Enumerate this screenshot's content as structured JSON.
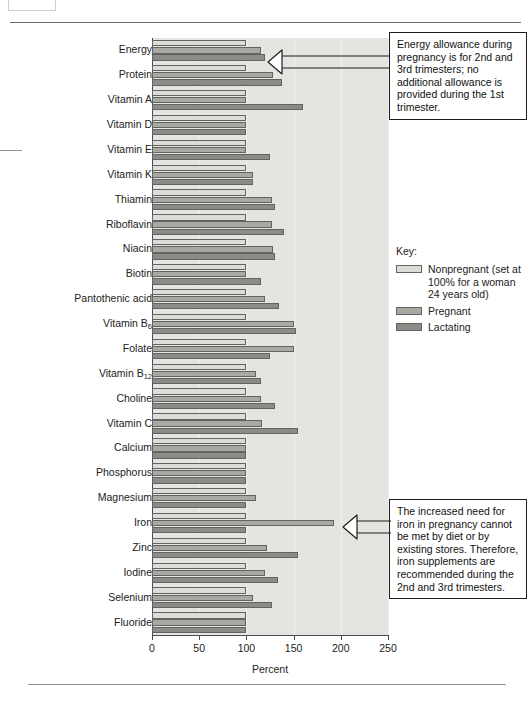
{
  "chart_data": {
    "type": "bar",
    "orientation": "horizontal",
    "title": "",
    "xlabel": "Percent",
    "ylabel": "",
    "xlim": [
      0,
      250
    ],
    "xticks": [
      0,
      50,
      100,
      150,
      200,
      250
    ],
    "grid": true,
    "legend_position": "right",
    "categories": [
      "Energy",
      "Protein",
      "Vitamin A",
      "Vitamin D",
      "Vitamin E",
      "Vitamin K",
      "Thiamin",
      "Riboflavin",
      "Niacin",
      "Biotin",
      "Pantothenic acid",
      "Vitamin B6",
      "Folate",
      "Vitamin B12",
      "Choline",
      "Vitamin C",
      "Calcium",
      "Phosphorus",
      "Magnesium",
      "Iron",
      "Zinc",
      "Iodine",
      "Selenium",
      "Fluoride"
    ],
    "categories_html": [
      "Energy",
      "Protein",
      "Vitamin A",
      "Vitamin D",
      "Vitamin E",
      "Vitamin K",
      "Thiamin",
      "Riboflavin",
      "Niacin",
      "Biotin",
      "Pantothenic acid",
      "Vitamin B<sub>6</sub>",
      "Folate",
      "Vitamin B<sub>12</sub>",
      "Choline",
      "Vitamin C",
      "Calcium",
      "Phosphorus",
      "Magnesium",
      "Iron",
      "Zinc",
      "Iodine",
      "Selenium",
      "Fluoride"
    ],
    "series": [
      {
        "name": "Nonpregnant",
        "color": "#dcdcd8",
        "values": [
          100,
          100,
          100,
          100,
          100,
          100,
          100,
          100,
          100,
          100,
          100,
          100,
          100,
          100,
          100,
          100,
          100,
          100,
          100,
          100,
          100,
          100,
          100,
          100
        ]
      },
      {
        "name": "Pregnant",
        "color": "#a9a9a4",
        "values": [
          115,
          128,
          100,
          100,
          100,
          107,
          127,
          127,
          128,
          100,
          120,
          150,
          150,
          110,
          115,
          117,
          100,
          100,
          110,
          193,
          122,
          120,
          107,
          100
        ]
      },
      {
        "name": "Lactating",
        "color": "#8b8b87",
        "values": [
          120,
          138,
          160,
          100,
          125,
          107,
          130,
          140,
          130,
          115,
          135,
          153,
          125,
          115,
          130,
          155,
          100,
          100,
          100,
          100,
          155,
          133,
          127,
          100
        ]
      }
    ]
  },
  "legend": {
    "title": "Key:",
    "entries": [
      {
        "label": "Nonpregnant (set at 100% for a woman 24 years old)",
        "swatch": "np"
      },
      {
        "label": "Pregnant",
        "swatch": "pg"
      },
      {
        "label": "Lactating",
        "swatch": "lc"
      }
    ]
  },
  "callouts": {
    "energy": "Energy allowance during pregnancy is for 2nd and 3rd trimesters; no additional allowance is provided during the 1st trimester.",
    "iron": "The increased need for iron in pregnancy cannot be met by diet or by existing stores. Therefore, iron supplements are recommended during the 2nd and 3rd trimesters."
  }
}
